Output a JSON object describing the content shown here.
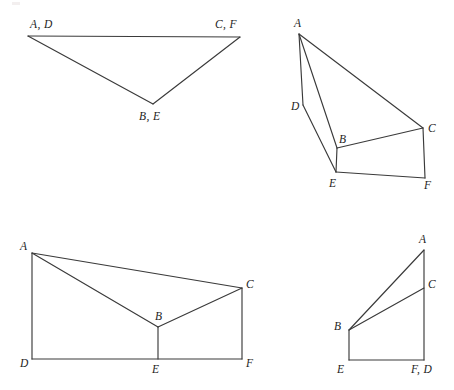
{
  "page": {
    "title": "Congruent triangle correspondence figures",
    "background_color": "#ffffff",
    "stroke_color": "#3a3a3a",
    "label_color": "#1d1d1d",
    "width": 454,
    "height": 390
  },
  "figures": [
    {
      "id": "figure-top-left",
      "name": "flat-overlapping-triangle",
      "description": "Triangle with vertex pairs coinciding",
      "vertices": [
        {
          "key": "AD",
          "label": "A, D",
          "x": 28,
          "y": 36,
          "label_x": 30,
          "label_y": 28,
          "anchor": "start"
        },
        {
          "key": "CF",
          "label": "C, F",
          "x": 240,
          "y": 37,
          "label_x": 215,
          "label_y": 28,
          "anchor": "start"
        },
        {
          "key": "BE",
          "label": "B, E",
          "x": 153,
          "y": 104,
          "label_x": 139,
          "label_y": 120,
          "anchor": "start"
        }
      ],
      "edges": [
        {
          "from": "AD",
          "to": "CF"
        },
        {
          "from": "AD",
          "to": "BE"
        },
        {
          "from": "BE",
          "to": "CF"
        }
      ]
    },
    {
      "id": "figure-top-right",
      "name": "slanted-quadrilateral-with-triangles",
      "description": "Two triangles sharing slanted orientation",
      "vertices": [
        {
          "key": "A",
          "label": "A",
          "x": 299,
          "y": 34,
          "label_x": 294,
          "label_y": 27,
          "anchor": "start"
        },
        {
          "key": "D",
          "label": "D",
          "x": 303,
          "y": 105,
          "label_x": 291,
          "label_y": 110,
          "anchor": "start"
        },
        {
          "key": "B",
          "label": "B",
          "x": 337,
          "y": 148,
          "label_x": 339,
          "label_y": 143,
          "anchor": "start"
        },
        {
          "key": "E",
          "label": "E",
          "x": 336,
          "y": 172,
          "label_x": 329,
          "label_y": 187,
          "anchor": "start"
        },
        {
          "key": "C",
          "label": "C",
          "x": 423,
          "y": 128,
          "label_x": 428,
          "label_y": 132,
          "anchor": "start"
        },
        {
          "key": "F",
          "label": "F",
          "x": 425,
          "y": 178,
          "label_x": 424,
          "label_y": 189,
          "anchor": "start"
        }
      ],
      "edges": [
        {
          "from": "A",
          "to": "D"
        },
        {
          "from": "D",
          "to": "E"
        },
        {
          "from": "A",
          "to": "B"
        },
        {
          "from": "A",
          "to": "C"
        },
        {
          "from": "B",
          "to": "C"
        },
        {
          "from": "B",
          "to": "E"
        },
        {
          "from": "E",
          "to": "F"
        },
        {
          "from": "C",
          "to": "F"
        }
      ]
    },
    {
      "id": "figure-bottom-left",
      "name": "wide-trapezoid-with-inner-vertex",
      "description": "Wide figure with interior vertex B over base DEF",
      "vertices": [
        {
          "key": "A",
          "label": "A",
          "x": 32,
          "y": 253,
          "label_x": 20,
          "label_y": 250,
          "anchor": "start"
        },
        {
          "key": "C",
          "label": "C",
          "x": 242,
          "y": 288,
          "label_x": 246,
          "label_y": 288,
          "anchor": "start"
        },
        {
          "key": "B",
          "label": "B",
          "x": 158,
          "y": 327,
          "label_x": 155,
          "label_y": 320,
          "anchor": "start"
        },
        {
          "key": "D",
          "label": "D",
          "x": 32,
          "y": 359,
          "label_x": 20,
          "label_y": 367,
          "anchor": "start"
        },
        {
          "key": "E",
          "label": "E",
          "x": 158,
          "y": 359,
          "label_x": 152,
          "label_y": 373,
          "anchor": "start"
        },
        {
          "key": "F",
          "label": "F",
          "x": 242,
          "y": 359,
          "label_x": 246,
          "label_y": 367,
          "anchor": "start"
        }
      ],
      "edges": [
        {
          "from": "A",
          "to": "C"
        },
        {
          "from": "A",
          "to": "B"
        },
        {
          "from": "B",
          "to": "C"
        },
        {
          "from": "A",
          "to": "D"
        },
        {
          "from": "D",
          "to": "F"
        },
        {
          "from": "B",
          "to": "E"
        },
        {
          "from": "C",
          "to": "F"
        }
      ]
    },
    {
      "id": "figure-bottom-right",
      "name": "narrow-right-figure",
      "description": "Narrow figure with F and D coinciding at base right",
      "vertices": [
        {
          "key": "A",
          "label": "A",
          "x": 424,
          "y": 250,
          "label_x": 419,
          "label_y": 243,
          "anchor": "start"
        },
        {
          "key": "C",
          "label": "C",
          "x": 424,
          "y": 288,
          "label_x": 428,
          "label_y": 288,
          "anchor": "start"
        },
        {
          "key": "B",
          "label": "B",
          "x": 349,
          "y": 330,
          "label_x": 334,
          "label_y": 330,
          "anchor": "start"
        },
        {
          "key": "E",
          "label": "E",
          "x": 349,
          "y": 360,
          "label_x": 337,
          "label_y": 373,
          "anchor": "start"
        },
        {
          "key": "FD",
          "label": "F, D",
          "x": 424,
          "y": 360,
          "label_x": 411,
          "label_y": 373,
          "anchor": "start"
        }
      ],
      "edges": [
        {
          "from": "A",
          "to": "B"
        },
        {
          "from": "B",
          "to": "C"
        },
        {
          "from": "A",
          "to": "FD"
        },
        {
          "from": "B",
          "to": "E"
        },
        {
          "from": "E",
          "to": "FD"
        }
      ]
    }
  ]
}
